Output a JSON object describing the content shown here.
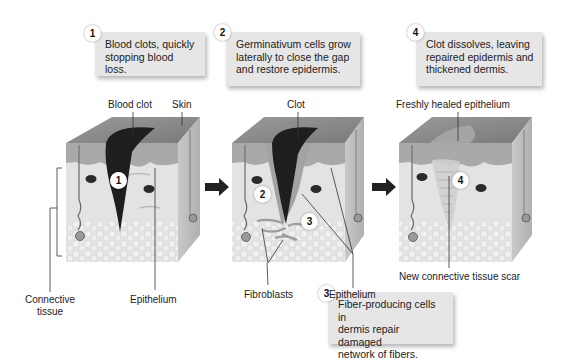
{
  "steps": [
    {
      "number": "1",
      "text_line1": "Blood clots, quickly",
      "text_line2": "stopping blood loss."
    },
    {
      "number": "2",
      "text_line1": "Germinativum cells grow",
      "text_line2": "laterally to close the gap",
      "text_line3": "and restore epidermis."
    },
    {
      "number": "3",
      "text_line1": "Fiber-producing cells in",
      "text_line2": "dermis repair damaged",
      "text_line3": "network of fibers."
    },
    {
      "number": "4",
      "text_line1": "Clot dissolves, leaving",
      "text_line2": "repaired epidermis and",
      "text_line3": "thickened dermis."
    }
  ],
  "labels": {
    "blood_clot": "Blood clot",
    "skin": "Skin",
    "clot": "Clot",
    "freshly_healed": "Freshly healed epithelium",
    "connective_line1": "Connective",
    "connective_line2": "tissue",
    "epithelium_1": "Epithelium",
    "fibroblasts": "Fibroblasts",
    "epithelium_2": "Epithelium",
    "scar": "New connective tissue scar"
  },
  "markers": {
    "block1": "1",
    "block2a": "2",
    "block2b": "3",
    "block3": "4"
  },
  "colors": {
    "callout_bg": "#e6e6e6",
    "skin_top": "#8c8c8c",
    "dermis": "#e2e2e2",
    "epidermis": "#a8a8a8",
    "clot": "#1e1e1e",
    "side_face": "#bdbdbd"
  }
}
